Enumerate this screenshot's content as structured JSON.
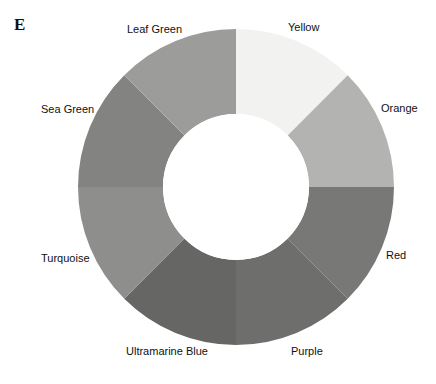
{
  "figure": {
    "panel_label": "E",
    "type": "color-wheel",
    "background_color": "#ffffff",
    "label_text_color": "#111111"
  },
  "wheel": {
    "center_x": 236,
    "center_y": 187,
    "outer_radius": 158,
    "inner_radius": 73,
    "inner_fill": "#ffffff",
    "segment_count": 8,
    "segment_span_degrees": 45,
    "start_angle_degrees": 0
  },
  "chart_data": {
    "type": "pie",
    "title": "",
    "subtitle": "",
    "xlabel": "",
    "ylabel": "",
    "legend_position": "radial-outside",
    "grid": false,
    "categories": [
      "Yellow",
      "Orange",
      "Red",
      "Purple",
      "Ultramarine Blue",
      "Turquoise",
      "Sea Green",
      "Leaf Green"
    ],
    "values": [
      12.5,
      12.5,
      12.5,
      12.5,
      12.5,
      12.5,
      12.5,
      12.5
    ],
    "series": [
      {
        "name": "segments",
        "values": [
          12.5,
          12.5,
          12.5,
          12.5,
          12.5,
          12.5,
          12.5,
          12.5
        ]
      }
    ],
    "slices": [
      {
        "label": "Yellow",
        "value": 12.5,
        "start_angle": 0,
        "end_angle": 45,
        "color": "#f2f2f0",
        "label_x": 288,
        "label_y": 21
      },
      {
        "label": "Orange",
        "value": 12.5,
        "start_angle": 45,
        "end_angle": 90,
        "color": "#b3b3b1",
        "label_x": 381,
        "label_y": 102
      },
      {
        "label": "Red",
        "value": 12.5,
        "start_angle": 90,
        "end_angle": 135,
        "color": "#787877",
        "label_x": 386,
        "label_y": 249
      },
      {
        "label": "Purple",
        "value": 12.5,
        "start_angle": 135,
        "end_angle": 180,
        "color": "#6e6e6d",
        "label_x": 291,
        "label_y": 345
      },
      {
        "label": "Ultramarine Blue",
        "value": 12.5,
        "start_angle": 180,
        "end_angle": 225,
        "color": "#666665",
        "label_x": 126,
        "label_y": 345
      },
      {
        "label": "Turquoise",
        "value": 12.5,
        "start_angle": 225,
        "end_angle": 270,
        "color": "#8e8e8c",
        "label_x": 41,
        "label_y": 252
      },
      {
        "label": "Sea Green",
        "value": 12.5,
        "start_angle": 270,
        "end_angle": 315,
        "color": "#838382",
        "label_x": 41,
        "label_y": 103
      },
      {
        "label": "Leaf Green",
        "value": 12.5,
        "start_angle": 315,
        "end_angle": 360,
        "color": "#9c9c9a",
        "label_x": 127,
        "label_y": 23
      }
    ]
  }
}
